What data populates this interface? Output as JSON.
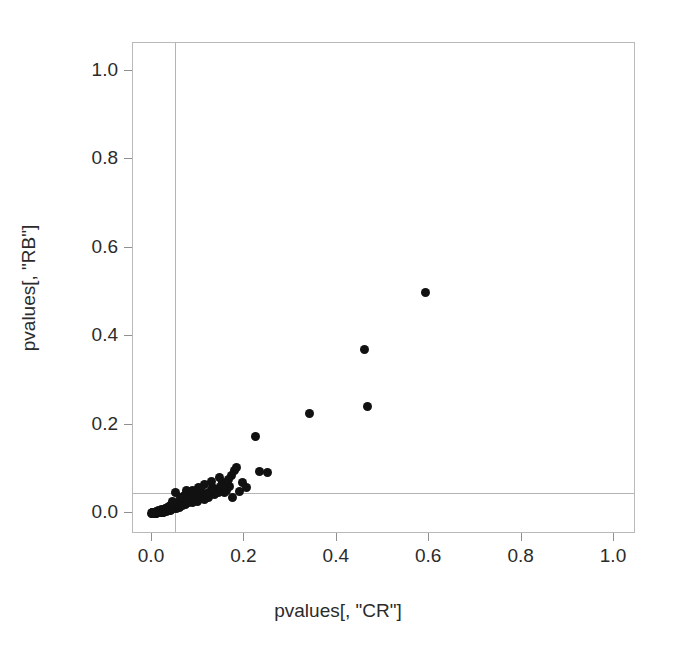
{
  "chart_data": {
    "type": "scatter",
    "title": "",
    "xlabel": "pvalues[, \"CR\"]",
    "ylabel": "pvalues[, \"RB\"]",
    "xlim": [
      -0.035,
      1.05
    ],
    "ylim": [
      -0.045,
      1.06
    ],
    "xticks": [
      0.0,
      0.2,
      0.4,
      0.6,
      0.8,
      1.0
    ],
    "yticks": [
      0.0,
      0.2,
      0.4,
      0.6,
      0.8,
      1.0
    ],
    "xticklabels": [
      "0.0",
      "0.2",
      "0.4",
      "0.6",
      "0.8",
      "1.0"
    ],
    "yticklabels": [
      "0.0",
      "0.2",
      "0.4",
      "0.6",
      "0.8",
      "1.0"
    ],
    "grid": false,
    "legend": null,
    "marker": "filled-circle",
    "marker_color": "#111111",
    "marker_size": 9,
    "reference_lines": [
      {
        "orientation": "vertical",
        "value": 0.05,
        "color": "#b4b4b4"
      },
      {
        "orientation": "horizontal",
        "value": 0.045,
        "color": "#b4b4b4"
      }
    ],
    "points": [
      {
        "x": 0.591,
        "y": 0.5
      },
      {
        "x": 0.459,
        "y": 0.371
      },
      {
        "x": 0.466,
        "y": 0.24
      },
      {
        "x": 0.341,
        "y": 0.224
      },
      {
        "x": 0.224,
        "y": 0.172
      },
      {
        "x": 0.233,
        "y": 0.094
      },
      {
        "x": 0.249,
        "y": 0.091
      },
      {
        "x": 0.196,
        "y": 0.069
      },
      {
        "x": 0.183,
        "y": 0.104
      },
      {
        "x": 0.178,
        "y": 0.097
      },
      {
        "x": 0.172,
        "y": 0.085
      },
      {
        "x": 0.168,
        "y": 0.061
      },
      {
        "x": 0.161,
        "y": 0.052
      },
      {
        "x": 0.158,
        "y": 0.047
      },
      {
        "x": 0.152,
        "y": 0.07
      },
      {
        "x": 0.148,
        "y": 0.06
      },
      {
        "x": 0.143,
        "y": 0.046
      },
      {
        "x": 0.139,
        "y": 0.053
      },
      {
        "x": 0.135,
        "y": 0.041
      },
      {
        "x": 0.13,
        "y": 0.057
      },
      {
        "x": 0.126,
        "y": 0.049
      },
      {
        "x": 0.122,
        "y": 0.036
      },
      {
        "x": 0.118,
        "y": 0.044
      },
      {
        "x": 0.114,
        "y": 0.03
      },
      {
        "x": 0.11,
        "y": 0.04
      },
      {
        "x": 0.106,
        "y": 0.051
      },
      {
        "x": 0.102,
        "y": 0.033
      },
      {
        "x": 0.099,
        "y": 0.027
      },
      {
        "x": 0.096,
        "y": 0.044
      },
      {
        "x": 0.093,
        "y": 0.038
      },
      {
        "x": 0.09,
        "y": 0.029
      },
      {
        "x": 0.087,
        "y": 0.023
      },
      {
        "x": 0.084,
        "y": 0.035
      },
      {
        "x": 0.081,
        "y": 0.031
      },
      {
        "x": 0.078,
        "y": 0.024
      },
      {
        "x": 0.075,
        "y": 0.051
      },
      {
        "x": 0.073,
        "y": 0.019
      },
      {
        "x": 0.071,
        "y": 0.028
      },
      {
        "x": 0.068,
        "y": 0.022
      },
      {
        "x": 0.066,
        "y": 0.016
      },
      {
        "x": 0.064,
        "y": 0.026
      },
      {
        "x": 0.062,
        "y": 0.02
      },
      {
        "x": 0.06,
        "y": 0.013
      },
      {
        "x": 0.058,
        "y": 0.023
      },
      {
        "x": 0.056,
        "y": 0.017
      },
      {
        "x": 0.054,
        "y": 0.011
      },
      {
        "x": 0.052,
        "y": 0.021
      },
      {
        "x": 0.05,
        "y": 0.046
      },
      {
        "x": 0.049,
        "y": 0.015
      },
      {
        "x": 0.047,
        "y": 0.01
      },
      {
        "x": 0.046,
        "y": 0.019
      },
      {
        "x": 0.044,
        "y": 0.013
      },
      {
        "x": 0.043,
        "y": 0.008
      },
      {
        "x": 0.041,
        "y": 0.016
      },
      {
        "x": 0.04,
        "y": 0.011
      },
      {
        "x": 0.039,
        "y": 0.006
      },
      {
        "x": 0.037,
        "y": 0.014
      },
      {
        "x": 0.036,
        "y": 0.009
      },
      {
        "x": 0.035,
        "y": 0.005
      },
      {
        "x": 0.034,
        "y": 0.012
      },
      {
        "x": 0.033,
        "y": 0.007
      },
      {
        "x": 0.032,
        "y": 0.004
      },
      {
        "x": 0.03,
        "y": 0.01
      },
      {
        "x": 0.029,
        "y": 0.006
      },
      {
        "x": 0.028,
        "y": 0.003
      },
      {
        "x": 0.027,
        "y": 0.009
      },
      {
        "x": 0.026,
        "y": 0.005
      },
      {
        "x": 0.025,
        "y": 0.002
      },
      {
        "x": 0.024,
        "y": 0.008
      },
      {
        "x": 0.023,
        "y": 0.004
      },
      {
        "x": 0.022,
        "y": 0.002
      },
      {
        "x": 0.021,
        "y": 0.007
      },
      {
        "x": 0.02,
        "y": 0.003
      },
      {
        "x": 0.019,
        "y": 0.001
      },
      {
        "x": 0.018,
        "y": 0.006
      },
      {
        "x": 0.017,
        "y": 0.003
      },
      {
        "x": 0.016,
        "y": 0.001
      },
      {
        "x": 0.015,
        "y": 0.005
      },
      {
        "x": 0.014,
        "y": 0.002
      },
      {
        "x": 0.013,
        "y": 0.001
      },
      {
        "x": 0.012,
        "y": 0.004
      },
      {
        "x": 0.011,
        "y": 0.002
      },
      {
        "x": 0.01,
        "y": 0.0
      },
      {
        "x": 0.009,
        "y": 0.003
      },
      {
        "x": 0.008,
        "y": 0.001
      },
      {
        "x": 0.008,
        "y": 0.0
      },
      {
        "x": 0.007,
        "y": 0.002
      },
      {
        "x": 0.006,
        "y": 0.001
      },
      {
        "x": 0.006,
        "y": 0.0
      },
      {
        "x": 0.005,
        "y": 0.002
      },
      {
        "x": 0.005,
        "y": 0.001
      },
      {
        "x": 0.004,
        "y": 0.0
      },
      {
        "x": 0.004,
        "y": 0.001
      },
      {
        "x": 0.003,
        "y": 0.0
      },
      {
        "x": 0.003,
        "y": 0.001
      },
      {
        "x": 0.002,
        "y": 0.0
      },
      {
        "x": 0.002,
        "y": 0.001
      },
      {
        "x": 0.001,
        "y": 0.0
      },
      {
        "x": 0.001,
        "y": 0.001
      },
      {
        "x": 0.0,
        "y": 0.0
      },
      {
        "x": 0.0,
        "y": 0.001
      },
      {
        "x": -0.001,
        "y": 0.0
      },
      {
        "x": 0.205,
        "y": 0.058
      },
      {
        "x": 0.19,
        "y": 0.049
      },
      {
        "x": 0.175,
        "y": 0.035
      },
      {
        "x": 0.165,
        "y": 0.075
      },
      {
        "x": 0.147,
        "y": 0.081
      },
      {
        "x": 0.128,
        "y": 0.072
      },
      {
        "x": 0.113,
        "y": 0.065
      },
      {
        "x": 0.1,
        "y": 0.058
      },
      {
        "x": 0.088,
        "y": 0.052
      },
      {
        "x": 0.07,
        "y": 0.04
      },
      {
        "x": 0.061,
        "y": 0.034
      },
      {
        "x": 0.045,
        "y": 0.027
      }
    ]
  }
}
